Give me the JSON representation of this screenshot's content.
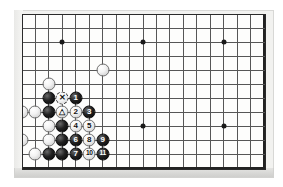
{
  "diagram": {
    "type": "go-board-diagram",
    "board": {
      "cols": 19,
      "rows": 12,
      "origin_x": 22,
      "origin_y": 14,
      "step_x": 13.45,
      "step_y": 14.0,
      "line_color": "#565656",
      "edge_color": "#222222",
      "surface_color": "#fdfdfc",
      "frame_color": "#2a2a2a"
    },
    "star_points": [
      {
        "col": 3,
        "row": 2
      },
      {
        "col": 9,
        "row": 2
      },
      {
        "col": 15,
        "row": 2
      },
      {
        "col": 9,
        "row": 8
      },
      {
        "col": 15,
        "row": 8
      }
    ],
    "stones": [
      {
        "col": 6,
        "row": 4,
        "color": "white",
        "label": ""
      },
      {
        "col": 2,
        "row": 5,
        "color": "white",
        "label": ""
      },
      {
        "col": 2,
        "row": 6,
        "color": "black",
        "label": ""
      },
      {
        "col": 3,
        "row": 6,
        "color": "white",
        "label": "✕",
        "mark": "x"
      },
      {
        "col": 4,
        "row": 6,
        "color": "black",
        "label": "1"
      },
      {
        "col": 0,
        "row": 7,
        "color": "white",
        "label": ""
      },
      {
        "col": 1,
        "row": 7,
        "color": "white",
        "label": ""
      },
      {
        "col": 2,
        "row": 7,
        "color": "black",
        "label": ""
      },
      {
        "col": 3,
        "row": 7,
        "color": "white",
        "label": "△",
        "mark": "triangle"
      },
      {
        "col": 4,
        "row": 7,
        "color": "white",
        "label": "2"
      },
      {
        "col": 5,
        "row": 7,
        "color": "black",
        "label": "3"
      },
      {
        "col": 2,
        "row": 8,
        "color": "white",
        "label": ""
      },
      {
        "col": 3,
        "row": 8,
        "color": "black",
        "label": ""
      },
      {
        "col": 4,
        "row": 8,
        "color": "white",
        "label": "4"
      },
      {
        "col": 5,
        "row": 8,
        "color": "white",
        "label": "5"
      },
      {
        "col": 0,
        "row": 9,
        "color": "white",
        "label": ""
      },
      {
        "col": 2,
        "row": 9,
        "color": "white",
        "label": ""
      },
      {
        "col": 3,
        "row": 9,
        "color": "black",
        "label": ""
      },
      {
        "col": 4,
        "row": 9,
        "color": "black",
        "label": "6"
      },
      {
        "col": 5,
        "row": 9,
        "color": "white",
        "label": "8"
      },
      {
        "col": 6,
        "row": 9,
        "color": "black",
        "label": "9"
      },
      {
        "col": 1,
        "row": 10,
        "color": "white",
        "label": ""
      },
      {
        "col": 2,
        "row": 10,
        "color": "black",
        "label": ""
      },
      {
        "col": 3,
        "row": 10,
        "color": "black",
        "label": ""
      },
      {
        "col": 4,
        "row": 10,
        "color": "black",
        "label": "7"
      },
      {
        "col": 5,
        "row": 10,
        "color": "white",
        "label": "10"
      },
      {
        "col": 6,
        "row": 10,
        "color": "black",
        "label": "11"
      }
    ]
  }
}
